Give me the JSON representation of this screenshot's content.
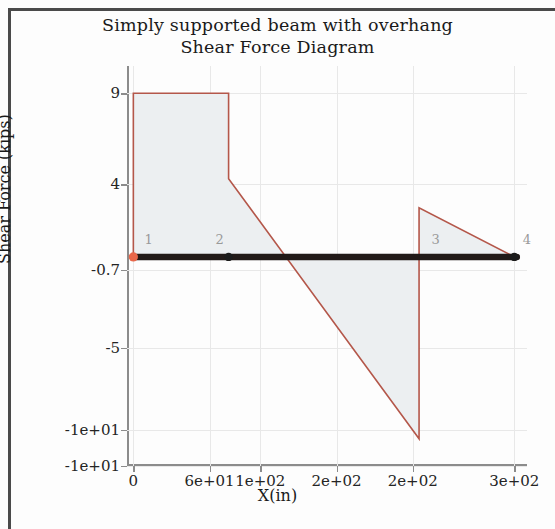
{
  "figure": {
    "title_line1": "Simply supported beam with overhang",
    "title_line2": "Shear Force Diagram"
  },
  "chart_data": {
    "type": "line",
    "title": "Simply supported beam with overhang\nShear Force Diagram",
    "xlabel": "X(in)",
    "ylabel": "Shear Force (kips)",
    "xlim": [
      -5,
      310
    ],
    "ylim": [
      -11.5,
      10.5
    ],
    "grid": true,
    "legend": null,
    "xticks": [
      0,
      60,
      100,
      160,
      220,
      300
    ],
    "xticklabels": [
      "0",
      "6e+01",
      "1e+02",
      "2e+02",
      "2e+02",
      "3e+02"
    ],
    "yticks": [
      9,
      4,
      -0.7,
      -5,
      -9.5,
      -11.5
    ],
    "yticklabels": [
      "9",
      "4",
      "-0.7",
      "-5",
      "-1e+01",
      "-1e+01"
    ],
    "series": [
      {
        "name": "Shear force",
        "color": "#b4574a",
        "fill": "#eceff1",
        "x": [
          0,
          0,
          75,
          75,
          225,
          225,
          300,
          300
        ],
        "y": [
          0,
          9,
          9,
          4.3,
          -10,
          2.7,
          0,
          0
        ]
      }
    ],
    "beam": {
      "name": "beam-axis",
      "color": "#221a18",
      "x_start": 0,
      "x_end": 302,
      "y": 0
    },
    "nodes": [
      {
        "label": "1",
        "x": 0,
        "y": 0,
        "marker": "support",
        "color": "#e8674a"
      },
      {
        "label": "2",
        "x": 75,
        "y": 0,
        "marker": "dot",
        "color": "#1b1b1b"
      },
      {
        "label": "3",
        "x": 225,
        "y": 0,
        "marker": "tick",
        "color": "#1b1b1b"
      },
      {
        "label": "4",
        "x": 300,
        "y": 0,
        "marker": "dot",
        "color": "#1b1b1b"
      }
    ],
    "annotations": [
      {
        "text": "1",
        "x": 12,
        "y": 0.55
      },
      {
        "text": "2",
        "x": 68,
        "y": 0.55
      },
      {
        "text": "3",
        "x": 238,
        "y": 0.55
      },
      {
        "text": "4",
        "x": 310,
        "y": 0.55
      }
    ]
  }
}
